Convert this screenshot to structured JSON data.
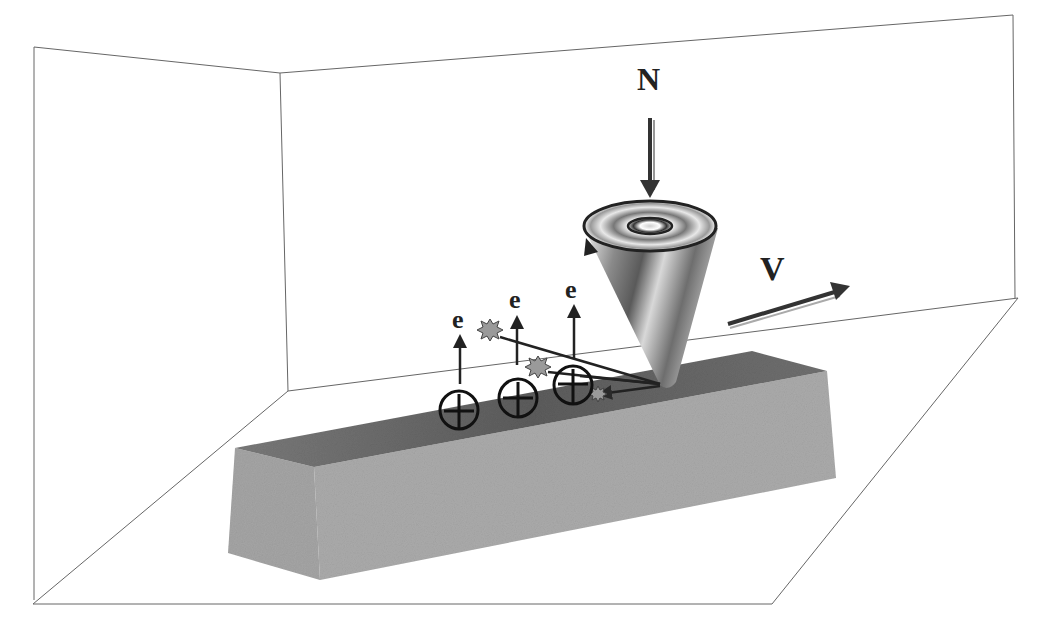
{
  "diagram": {
    "type": "3D schematic",
    "labels": {
      "normal_force": "N",
      "velocity": "V",
      "electrons": [
        "e",
        "e",
        "e"
      ]
    },
    "elements": {
      "indenter": "rotating cone tip pressed into sample",
      "sample": "rectangular bar with scratched groove",
      "charges": [
        "+",
        "+",
        "+"
      ],
      "particles": 3
    },
    "colors": {
      "background": "#ffffff",
      "wall_lines": "#555555",
      "box_top": "#6f6f6f",
      "box_front": "#a8a8a8",
      "box_side": "#9a9a9a",
      "arrow": "#2a2a2a",
      "particle": "#9a9a9a"
    }
  }
}
